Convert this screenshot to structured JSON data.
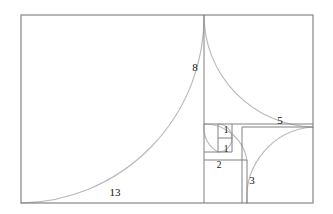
{
  "figure": {
    "type": "geometric-diagram",
    "canvas": {
      "width": 333,
      "height": 214,
      "background": "#ffffff"
    },
    "colors": {
      "square_stroke": "#808080",
      "outer_stroke": "#808080",
      "spiral_stroke": "#b9b9b9",
      "label_text": "#111111"
    },
    "unit_px": 13.9,
    "outer_rect": {
      "x": 21,
      "y": 15,
      "width": 292,
      "height": 188,
      "units_w": 21,
      "units_h": 13
    },
    "labels": {
      "l13": "13",
      "l8": "8",
      "l5": "5",
      "l3": "3",
      "l2": "2",
      "l1a": "1",
      "l1b": "1"
    },
    "squares": [
      {
        "name": "square-13",
        "label": "13",
        "side_units": 13,
        "x": 21,
        "y": 15,
        "size": 183
      },
      {
        "name": "square-8",
        "label": "8",
        "side_units": 8,
        "x": 204,
        "y": 15,
        "size": 109
      },
      {
        "name": "square-5",
        "label": "5",
        "side_units": 5,
        "x": 242,
        "y": 127,
        "size": 71
      },
      {
        "name": "square-3",
        "label": "3",
        "side_units": 3,
        "x": 204,
        "y": 160,
        "size": 43
      },
      {
        "name": "square-2",
        "label": "2",
        "side_units": 2,
        "x": 204,
        "y": 124,
        "size": 28
      },
      {
        "name": "square-1a",
        "label": "1",
        "side_units": 1,
        "x": 218,
        "y": 124,
        "size": 14
      },
      {
        "name": "square-1b",
        "label": "1",
        "side_units": 1,
        "x": 218,
        "y": 138,
        "size": 14
      }
    ],
    "label_positions": [
      {
        "key": "l13",
        "text": "13",
        "x": 115,
        "y": 193
      },
      {
        "key": "l8",
        "text": "8",
        "x": 195,
        "y": 68
      },
      {
        "key": "l5",
        "text": "5",
        "x": 280,
        "y": 122
      },
      {
        "key": "l3",
        "text": "3",
        "x": 251,
        "y": 181
      },
      {
        "key": "l2",
        "text": "2",
        "x": 219,
        "y": 166
      },
      {
        "key": "l1a",
        "text": "1",
        "x": 226,
        "y": 132
      },
      {
        "key": "l1b",
        "text": "1",
        "x": 226,
        "y": 152
      }
    ],
    "spiral_arcs": [
      {
        "name": "arc-13",
        "radius_units": 13,
        "from": "bottom-left",
        "sweep": "quarter"
      },
      {
        "name": "arc-8",
        "radius_units": 8,
        "from": "top-left",
        "sweep": "quarter"
      },
      {
        "name": "arc-5",
        "radius_units": 5,
        "from": "top-right",
        "sweep": "quarter"
      },
      {
        "name": "arc-3",
        "radius_units": 3,
        "from": "bottom-right",
        "sweep": "quarter"
      },
      {
        "name": "arc-2",
        "radius_units": 2,
        "from": "bottom-left",
        "sweep": "quarter"
      },
      {
        "name": "arc-1a",
        "radius_units": 1,
        "from": "top-left",
        "sweep": "quarter"
      },
      {
        "name": "arc-1b",
        "radius_units": 1,
        "from": "top-right",
        "sweep": "quarter"
      }
    ]
  }
}
